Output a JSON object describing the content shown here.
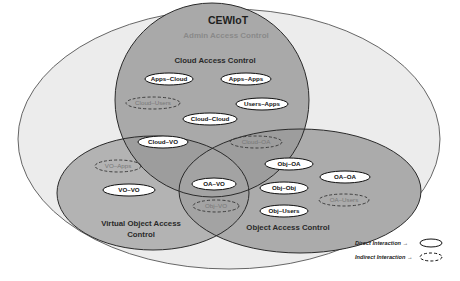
{
  "diagram": {
    "title": "CEWIoT",
    "outer_label": "Admin Access Control",
    "regions": {
      "cloud": {
        "label": "Cloud Access Control"
      },
      "virtual_object": {
        "label_line1": "Virtual Object Access",
        "label_line2": "Control"
      },
      "object": {
        "label": "Object Access Control"
      }
    },
    "interactions": [
      {
        "id": "apps-cloud",
        "label": "Apps–Cloud",
        "type": "direct",
        "region": "cloud"
      },
      {
        "id": "apps-apps",
        "label": "Apps–Apps",
        "type": "direct",
        "region": "cloud"
      },
      {
        "id": "cloud-users",
        "label": "Cloud–Users",
        "type": "indirect",
        "region": "cloud"
      },
      {
        "id": "users-apps",
        "label": "Users–Apps",
        "type": "direct",
        "region": "cloud"
      },
      {
        "id": "cloud-cloud",
        "label": "Cloud–Cloud",
        "type": "direct",
        "region": "cloud"
      },
      {
        "id": "cloud-vo",
        "label": "Cloud–VO",
        "type": "direct",
        "region": "cloud+virtual_object"
      },
      {
        "id": "cloud-oa",
        "label": "Cloud–OA",
        "type": "indirect",
        "region": "cloud+object"
      },
      {
        "id": "vo-apps",
        "label": "VO–Apps",
        "type": "indirect",
        "region": "virtual_object"
      },
      {
        "id": "vo-vo",
        "label": "VO–VO",
        "type": "direct",
        "region": "virtual_object"
      },
      {
        "id": "oa-vo",
        "label": "OA–VO",
        "type": "direct",
        "region": "virtual_object+object"
      },
      {
        "id": "obj-vo",
        "label": "Obj–VO",
        "type": "indirect",
        "region": "virtual_object+object"
      },
      {
        "id": "obj-oa",
        "label": "Obj–OA",
        "type": "direct",
        "region": "object"
      },
      {
        "id": "oa-oa",
        "label": "OA–OA",
        "type": "direct",
        "region": "object"
      },
      {
        "id": "obj-obj",
        "label": "Obj–Obj",
        "type": "direct",
        "region": "object"
      },
      {
        "id": "oa-users",
        "label": "OA–Users",
        "type": "indirect",
        "region": "object"
      },
      {
        "id": "obj-users",
        "label": "Obj–Users",
        "type": "direct",
        "region": "object"
      }
    ],
    "legend": {
      "direct": "Direct Interaction →",
      "indirect": "Indirect Interaction →"
    },
    "colors": {
      "outer_fill": "#ececec",
      "region_fill": "#a8a8a8",
      "overlap_fill": "#9a9a9a",
      "stroke": "#2a2a2a",
      "title_color": "#1e1e1e",
      "outer_label_color": "#8a8a8a",
      "pill_fill": "#ffffff",
      "indirect_text": "#777777"
    }
  }
}
